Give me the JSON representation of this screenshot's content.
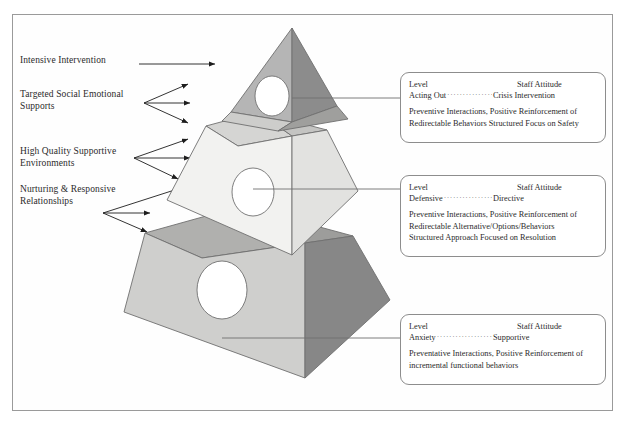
{
  "diagram": {
    "frame_border_color": "#9a9a9a",
    "background": "#ffffff"
  },
  "left_labels": [
    {
      "id": "intensive-intervention",
      "text": "Intensive Intervention",
      "x": 20,
      "y": 54,
      "arrow_style": "single"
    },
    {
      "id": "targeted-social-emotional-supports",
      "text": "Targeted Social Emotional\nSupports",
      "x": 20,
      "y": 88,
      "arrow_style": "fan"
    },
    {
      "id": "high-quality-supportive-environments",
      "text": "High Quality Supportive\nEnvironments",
      "x": 20,
      "y": 145,
      "arrow_style": "fan"
    },
    {
      "id": "nurturing-responsive-relationships",
      "text": "Nurturing & Responsive\nRelationships",
      "x": 20,
      "y": 183,
      "arrow_style": "fan"
    }
  ],
  "pyramid": {
    "apex": {
      "x": 292,
      "y": 28
    },
    "tiers": [
      {
        "name": "top-tier",
        "label": "Intensive Intervention tier",
        "left_face_color": "#b3b3b3",
        "right_face_color": "#8c8c8c",
        "rim_color": "#c9c9c9",
        "circle": true
      },
      {
        "name": "middle-tier",
        "label": "Targeted supports tier",
        "left_face_color": "#f0f0ee",
        "right_face_color": "#dcdcda",
        "rim_color": "#b9b9b7",
        "circle": true
      },
      {
        "name": "base-tier",
        "label": "Universal supports tier",
        "left_face_color": "#cfcfcd",
        "right_face_color": "#878787",
        "rim_color": "#a8a8a6",
        "circle": true
      }
    ],
    "outline_color": "#6f6f6f"
  },
  "info_boxes": [
    {
      "id": "box-acting-out",
      "x": 400,
      "y": 72,
      "w": 206,
      "h": 71,
      "connector_y": 98,
      "header": {
        "level": "Level",
        "attitude": "Staff Attitude"
      },
      "row": {
        "level": "Acting Out",
        "attitude": "Crisis Intervention"
      },
      "body": [
        "Preventive Interactions, Positive Reinforcement of",
        "Redirectable Behaviors  Structured Focus on Safety"
      ]
    },
    {
      "id": "box-defensive",
      "x": 400,
      "y": 175,
      "w": 206,
      "h": 82,
      "connector_y": 189,
      "header": {
        "level": "Level",
        "attitude": "Staff Attitude"
      },
      "row": {
        "level": "Defensive",
        "attitude": "Directive"
      },
      "body": [
        "Preventive Interactions, Positive Reinforcement of",
        "Redirectable Alternative/Options/Behaviors",
        "Structured Approach Focused on Resolution"
      ]
    },
    {
      "id": "box-anxiety",
      "x": 400,
      "y": 314,
      "w": 206,
      "h": 71,
      "connector_y": 338,
      "header": {
        "level": "Level",
        "attitude": "Staff Attitude"
      },
      "row": {
        "level": "Anxiety",
        "attitude": "Supportive"
      },
      "body": [
        "Preventative Interactions, Positive Reinforcement of",
        "incremental functional behaviors"
      ]
    }
  ],
  "dots": "······································"
}
